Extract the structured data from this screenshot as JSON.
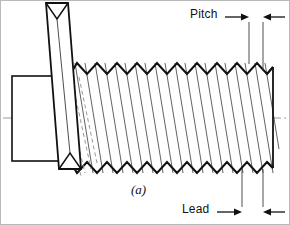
{
  "figure": {
    "caption": "(a)",
    "domain": "engineering-drawing",
    "background_color": "#ffffff",
    "line_color": "#111111",
    "thin_line_color": "#3a3a3a",
    "centerline_color": "#9a9a9a",
    "frame_color": "#b9b9b9"
  },
  "dimensions": {
    "pitch": {
      "label": "Pitch",
      "label_x": 189,
      "label_y": 6,
      "arrow_left_x": 236,
      "arrow_right_x": 270,
      "arrow_y": 16,
      "extension_line_1_x": 248,
      "extension_line_2_x": 262,
      "extension_top_y": 22,
      "extension_bottom_y": 63
    },
    "lead": {
      "label": "Lead",
      "label_x": 181,
      "label_y": 201,
      "arrow_left_x": 228,
      "arrow_right_x": 272,
      "arrow_y": 211,
      "extension_line_1_x": 241,
      "extension_line_2_x": 262,
      "extension_top_y": 172,
      "extension_bottom_y": 205
    }
  },
  "geometry": {
    "centerline_y": 117,
    "centerline_x_start": 2,
    "centerline_x_end": 288,
    "shank": {
      "left": 11,
      "right": 66,
      "top": 75,
      "bottom": 160
    },
    "thread": {
      "start_x": 72,
      "end_x": 272,
      "crest_y": 62,
      "root_y": 172,
      "crest_y_bottom": 172,
      "pitch_px": 20,
      "crest_count": 11
    },
    "helix_ribbon": {
      "top_x": 45,
      "top_y": 2,
      "bottom_x": 72,
      "bottom_y": 168,
      "width": 22
    }
  },
  "icons": {
    "arrow_left": "arrowhead-left",
    "arrow_right": "arrowhead-right"
  }
}
